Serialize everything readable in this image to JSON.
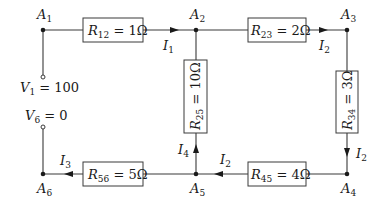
{
  "diagram": {
    "type": "resistor-circuit",
    "nodes": [
      {
        "id": "A1",
        "label": "A",
        "sub": "1"
      },
      {
        "id": "A2",
        "label": "A",
        "sub": "2"
      },
      {
        "id": "A3",
        "label": "A",
        "sub": "3"
      },
      {
        "id": "A4",
        "label": "A",
        "sub": "4"
      },
      {
        "id": "A5",
        "label": "A",
        "sub": "5"
      },
      {
        "id": "A6",
        "label": "A",
        "sub": "6"
      }
    ],
    "resistors": [
      {
        "id": "R12",
        "name": "R",
        "sub": "12",
        "value": " = 1Ω",
        "from": "A1",
        "to": "A2"
      },
      {
        "id": "R23",
        "name": "R",
        "sub": "23",
        "value": " = 2Ω",
        "from": "A2",
        "to": "A3"
      },
      {
        "id": "R25",
        "name": "R",
        "sub": "25",
        "value": " = 10Ω",
        "from": "A2",
        "to": "A5"
      },
      {
        "id": "R34",
        "name": "R",
        "sub": "34",
        "value": " = 3Ω",
        "from": "A3",
        "to": "A4"
      },
      {
        "id": "R45",
        "name": "R",
        "sub": "45",
        "value": " = 4Ω",
        "from": "A4",
        "to": "A5"
      },
      {
        "id": "R56",
        "name": "R",
        "sub": "56",
        "value": " = 5Ω",
        "from": "A5",
        "to": "A6"
      }
    ],
    "currents": [
      {
        "id": "I1",
        "label": "I",
        "sub": "1",
        "on": "A1→A2"
      },
      {
        "id": "I2a",
        "label": "I",
        "sub": "2",
        "on": "A2→A3"
      },
      {
        "id": "I2b",
        "label": "I",
        "sub": "2",
        "on": "A3→A4"
      },
      {
        "id": "I2c",
        "label": "I",
        "sub": "2",
        "on": "A4→A5"
      },
      {
        "id": "I4",
        "label": "I",
        "sub": "4",
        "on": "A5→A2"
      },
      {
        "id": "I3",
        "label": "I",
        "sub": "3",
        "on": "A5→A6"
      }
    ],
    "sources": [
      {
        "id": "V1",
        "label": "V",
        "sub": "1",
        "value": " = 100",
        "node": "A1"
      },
      {
        "id": "V6",
        "label": "V",
        "sub": "6",
        "value": " = 0",
        "node": "A6"
      }
    ]
  }
}
